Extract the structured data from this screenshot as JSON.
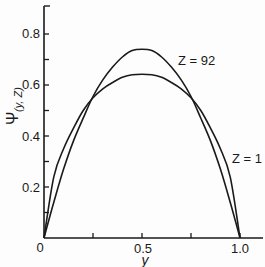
{
  "chart_data": {
    "type": "line",
    "title": "",
    "xlabel": "y",
    "ylabel": "Ψ(y, Z)",
    "xlim": [
      0,
      1.0
    ],
    "ylim": [
      0,
      0.9
    ],
    "grid": false,
    "legend": "inline annotations",
    "x_ticks": [
      0,
      0.25,
      0.5,
      0.75,
      1.0
    ],
    "x_tick_labels": [
      "0",
      "",
      "0.5",
      "",
      "1.0"
    ],
    "y_ticks": [
      0,
      0.1,
      0.2,
      0.3,
      0.4,
      0.5,
      0.6,
      0.7,
      0.8
    ],
    "y_tick_labels": [
      "0",
      "",
      "0.2",
      "",
      "0.4",
      "",
      "0.6",
      "",
      "0.8"
    ],
    "x": [
      0,
      0.05,
      0.1,
      0.15,
      0.2,
      0.25,
      0.3,
      0.35,
      0.4,
      0.45,
      0.5,
      0.55,
      0.6,
      0.65,
      0.7,
      0.75,
      0.8,
      0.85,
      0.9,
      0.95,
      1.0
    ],
    "series": [
      {
        "name": "Z = 92",
        "values": [
          0,
          0.14,
          0.27,
          0.38,
          0.47,
          0.555,
          0.62,
          0.67,
          0.71,
          0.735,
          0.74,
          0.735,
          0.71,
          0.67,
          0.62,
          0.555,
          0.47,
          0.38,
          0.27,
          0.14,
          0
        ]
      },
      {
        "name": "Z = 1",
        "values": [
          0,
          0.24,
          0.35,
          0.43,
          0.5,
          0.55,
          0.585,
          0.61,
          0.63,
          0.64,
          0.642,
          0.64,
          0.63,
          0.61,
          0.585,
          0.55,
          0.5,
          0.43,
          0.35,
          0.24,
          0
        ]
      }
    ],
    "annotations": [
      {
        "text": "Z = 92",
        "x": 0.68,
        "y": 0.69
      },
      {
        "text": "Z = 1",
        "x": 0.96,
        "y": 0.31
      }
    ]
  },
  "labels": {
    "x_axis_title": "y",
    "y_axis_title_main": "Ψ",
    "y_axis_title_sub": "(y, Z)",
    "x_tick_0": "0",
    "x_tick_05": "0.5",
    "x_tick_10": "1.0",
    "y_tick_02": "0.2",
    "y_tick_04": "0.4",
    "y_tick_06": "0.6",
    "y_tick_08": "0.8",
    "anno_z92": "Z = 92",
    "anno_z1": "Z = 1"
  }
}
